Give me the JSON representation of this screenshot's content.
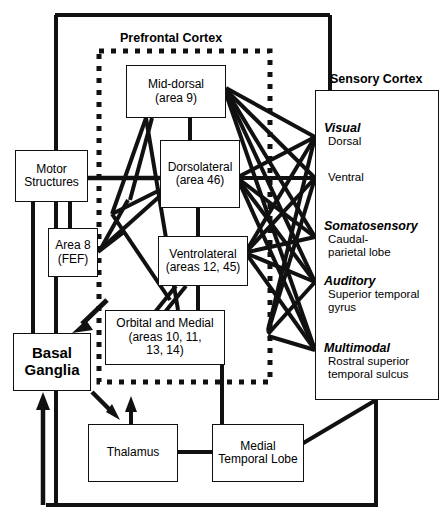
{
  "figure": {
    "type": "diagram"
  },
  "groups": {
    "prefrontal_label": "Prefrontal Cortex",
    "sensory_label": "Sensory Cortex"
  },
  "nodes": {
    "mid_dorsal": {
      "line1": "Mid-dorsal",
      "line2": "(area 9)"
    },
    "dorsolateral": {
      "line1": "Dorsolateral",
      "line2": "(area 46)"
    },
    "ventrolateral": {
      "line1": "Ventrolateral",
      "line2": "(areas 12, 45)"
    },
    "orbital_medial": {
      "line1": "Orbital and Medial",
      "line2": "(areas 10, 11,",
      "line3": "13, 14)"
    },
    "motor": {
      "line1": "Motor",
      "line2": "Structures"
    },
    "area8": {
      "line1": "Area 8",
      "line2": "(FEF)"
    },
    "basal_ganglia": {
      "line1": "Basal",
      "line2": "Ganglia"
    },
    "thalamus": {
      "line1": "Thalamus"
    },
    "medial_temporal": {
      "line1": "Medial",
      "line2": "Temporal Lobe"
    }
  },
  "sensory_regions": [
    {
      "heading": "Visual",
      "sub1": "Dorsal",
      "sub2": ""
    },
    {
      "heading": "",
      "sub1": "Ventral",
      "sub2": ""
    },
    {
      "heading": "Somatosensory",
      "sub1": "Caudal-",
      "sub2": "parietal lobe"
    },
    {
      "heading": "Auditory",
      "sub1": "Superior temporal",
      "sub2": "gyrus"
    },
    {
      "heading": "Multimodal",
      "sub1": "Rostral superior",
      "sub2": "temporal sulcus"
    }
  ],
  "colors": {
    "line": "#111111",
    "box_fill": "#ffffff",
    "text": "#000000"
  }
}
